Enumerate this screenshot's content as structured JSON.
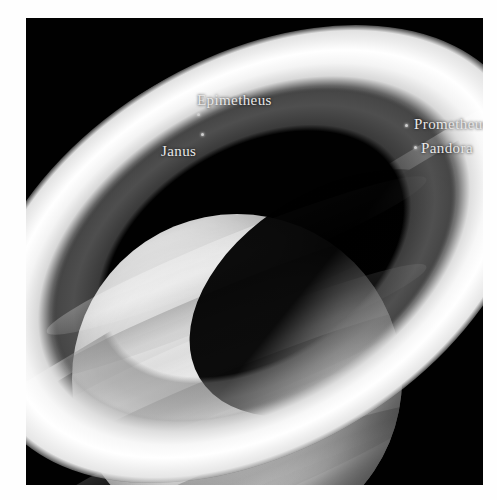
{
  "image": {
    "subject": "Saturn",
    "frame": {
      "background_color": "#010101",
      "border_color": "#ffffff"
    }
  },
  "annotations": {
    "moons": [
      {
        "name": "Epimetheus",
        "label": "Epimetheus",
        "label_x": 197,
        "label_y": 92,
        "dot_x": 197,
        "dot_y": 113
      },
      {
        "name": "Janus",
        "label": "Janus",
        "label_x": 161,
        "label_y": 143,
        "dot_x": 201,
        "dot_y": 133
      },
      {
        "name": "Prometheus",
        "label": "Prometheus",
        "label_x": 414,
        "label_y": 116,
        "dot_x": 405,
        "dot_y": 124
      },
      {
        "name": "Pandora",
        "label": "Pandora",
        "label_x": 421,
        "label_y": 140,
        "dot_x": 414,
        "dot_y": 146
      }
    ]
  },
  "rings": {
    "names": [
      "A Ring",
      "Cassini Division",
      "B Ring",
      "C Ring"
    ],
    "colors": {
      "a_ring": "#8f8f8f",
      "cassini_division": "#141414",
      "b_ring": "#f2f2f2",
      "c_ring": "#6d6d6d",
      "inner_gap": "#060606"
    }
  },
  "planet": {
    "body_color": "#bdbdbd",
    "shadow_color": "#000000"
  }
}
